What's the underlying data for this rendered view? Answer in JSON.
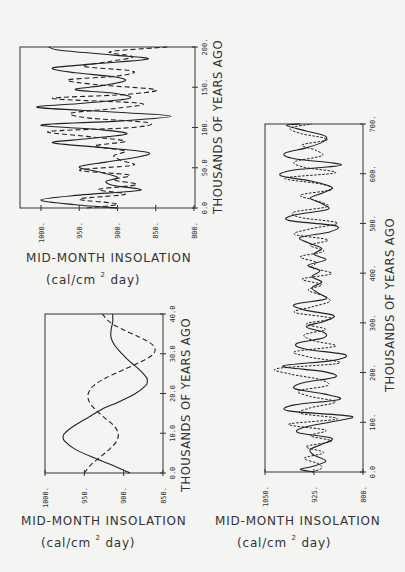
{
  "figure": {
    "value_label": "MID-MONTH INSOLATION",
    "unit_pre": "(cal/cm ",
    "unit_sup": "2",
    "unit_post": " day)",
    "time_label": "THOUSANDS OF YEARS AGO"
  },
  "chart_data": [
    {
      "id": "top-left",
      "type": "line",
      "title": "",
      "xlabel": "THOUSANDS OF YEARS AGO",
      "ylabel": "MID-MONTH INSOLATION (cal/cm² day)",
      "time_range": [
        0,
        200
      ],
      "value_range": [
        1028,
        800
      ],
      "time_ticks": [
        "0.0",
        "50.0",
        "100.",
        "150.",
        "200."
      ],
      "time_tick_values": [
        0,
        50,
        100,
        150,
        200
      ],
      "value_ticks": [
        "1000.",
        "950.",
        "900.",
        "850.",
        "800."
      ],
      "value_tick_values": [
        1000,
        950,
        900,
        850,
        800
      ],
      "grid": false,
      "series": [
        {
          "name": "solid",
          "style": "solid",
          "x": [
            0,
            4,
            10,
            16,
            22,
            28,
            33,
            38,
            45,
            51,
            57,
            63,
            69,
            75,
            81,
            86,
            92,
            97,
            103,
            108,
            114,
            119,
            125,
            130,
            136,
            142,
            147,
            152,
            158,
            163,
            168,
            174,
            179,
            185,
            190,
            196,
            200
          ],
          "values": [
            900,
            955,
            1000,
            950,
            870,
            905,
            915,
            900,
            925,
            950,
            915,
            875,
            860,
            920,
            985,
            940,
            888,
            920,
            1000,
            900,
            830,
            900,
            1005,
            945,
            885,
            900,
            955,
            920,
            890,
            905,
            955,
            985,
            930,
            860,
            905,
            975,
            990
          ]
        },
        {
          "name": "dashed",
          "style": "dashed",
          "x": [
            0,
            5,
            11,
            17,
            23,
            29,
            35,
            41,
            47,
            53,
            59,
            65,
            71,
            77,
            83,
            89,
            95,
            100,
            106,
            112,
            118,
            124,
            130,
            136,
            141,
            147,
            153,
            159,
            164,
            170,
            176,
            182,
            188,
            194,
            200
          ],
          "values": [
            940,
            900,
            950,
            890,
            925,
            875,
            905,
            885,
            950,
            880,
            895,
            905,
            890,
            930,
            890,
            940,
            990,
            880,
            860,
            940,
            960,
            900,
            870,
            985,
            890,
            850,
            925,
            965,
            900,
            880,
            945,
            910,
            880,
            910,
            835
          ]
        }
      ]
    },
    {
      "id": "bottom-left",
      "type": "line",
      "title": "",
      "xlabel": "THOUSANDS OF YEARS AGO",
      "ylabel": "MID-MONTH INSOLATION (cal/cm² day)",
      "time_range": [
        0,
        40
      ],
      "value_range": [
        1000,
        850
      ],
      "time_ticks": [
        "0.0",
        "10.0",
        "20.0",
        "30.0",
        "40.0"
      ],
      "time_tick_values": [
        0,
        10,
        20,
        30,
        40
      ],
      "value_ticks": [
        "1000.",
        "950.",
        "900.",
        "850."
      ],
      "value_tick_values": [
        1000,
        950,
        900,
        850
      ],
      "grid": false,
      "series": [
        {
          "name": "solid",
          "style": "solid",
          "x": [
            0,
            2,
            4,
            6,
            8,
            9,
            10,
            12,
            14,
            16,
            18,
            20,
            22,
            23,
            24,
            26,
            28,
            30,
            32,
            34,
            36,
            38,
            40
          ],
          "values": [
            892,
            915,
            940,
            962,
            975,
            977,
            975,
            962,
            945,
            928,
            905,
            885,
            872,
            870,
            871,
            880,
            892,
            902,
            911,
            916,
            916,
            914,
            914
          ],
          "note": "values estimated from pixel positions"
        },
        {
          "name": "dashed",
          "style": "dashed",
          "x": [
            0,
            2,
            4,
            6,
            8,
            10,
            12,
            14,
            16,
            18,
            20,
            22,
            24,
            26,
            28,
            30,
            32,
            34,
            36,
            38,
            40
          ],
          "values": [
            950,
            942,
            930,
            918,
            909,
            907,
            913,
            925,
            936,
            944,
            945,
            938,
            922,
            900,
            878,
            862,
            862,
            878,
            900,
            918,
            927
          ]
        }
      ]
    },
    {
      "id": "bottom-right",
      "type": "line",
      "title": "",
      "xlabel": "THOUSANDS OF YEARS AGO",
      "ylabel": "MID-MONTH INSOLATION (cal/cm² day)",
      "time_range": [
        0,
        700
      ],
      "value_range": [
        1050,
        800
      ],
      "time_ticks": [
        "0.0",
        "100.",
        "200.",
        "300.",
        "400.",
        "500.",
        "600.",
        "700."
      ],
      "time_tick_values": [
        0,
        100,
        200,
        300,
        400,
        500,
        600,
        700
      ],
      "value_ticks": [
        "1050.",
        "925.",
        "800."
      ],
      "value_tick_values": [
        1050,
        925,
        800
      ],
      "grid": false,
      "series": [
        {
          "name": "solid",
          "style": "solid",
          "x": [
            0,
            5,
            11,
            22,
            34,
            45,
            56,
            68,
            79,
            90,
            101,
            112,
            123,
            135,
            146,
            157,
            168,
            180,
            191,
            202,
            213,
            224,
            236,
            247,
            258,
            270,
            281,
            292,
            303,
            315,
            326,
            337,
            348,
            360,
            371,
            382,
            393,
            405,
            416,
            427,
            438,
            450,
            461,
            472,
            483,
            495,
            506,
            517,
            528,
            540,
            551,
            562,
            573,
            585,
            596,
            607,
            618,
            630,
            641,
            652,
            663,
            675,
            686,
            697,
            700
          ],
          "values": [
            925,
            960,
            930,
            895,
            925,
            935,
            905,
            880,
            965,
            950,
            880,
            830,
            990,
            975,
            860,
            900,
            975,
            950,
            870,
            900,
            1005,
            880,
            845,
            945,
            970,
            900,
            900,
            945,
            900,
            875,
            950,
            975,
            895,
            915,
            930,
            905,
            930,
            910,
            940,
            895,
            925,
            905,
            940,
            960,
            885,
            870,
            990,
            975,
            890,
            905,
            935,
            900,
            880,
            930,
            1010,
            980,
            855,
            975,
            1000,
            945,
            905,
            895,
            945,
            995,
            960
          ]
        },
        {
          "name": "dotted",
          "style": "dotted",
          "x": [
            0,
            8,
            17,
            28,
            39,
            51,
            62,
            73,
            84,
            96,
            107,
            118,
            129,
            141,
            152,
            163,
            174,
            186,
            197,
            208,
            219,
            231,
            242,
            253,
            264,
            276,
            287,
            298,
            309,
            321,
            332,
            343,
            354,
            366,
            377,
            388,
            399,
            411,
            422,
            433,
            444,
            456,
            467,
            478,
            489,
            501,
            512,
            523,
            534,
            546,
            557,
            568,
            579,
            591,
            602,
            613,
            624,
            636,
            647,
            658,
            669,
            681,
            692,
            700
          ],
          "values": [
            930,
            905,
            915,
            950,
            900,
            945,
            880,
            935,
            895,
            990,
            865,
            960,
            935,
            870,
            935,
            965,
            890,
            910,
            985,
            1020,
            860,
            935,
            975,
            870,
            925,
            950,
            895,
            945,
            880,
            975,
            930,
            885,
            900,
            940,
            905,
            955,
            880,
            930,
            920,
            960,
            900,
            935,
            890,
            975,
            935,
            865,
            960,
            975,
            890,
            920,
            960,
            880,
            905,
            1000,
            870,
            950,
            975,
            905,
            920,
            955,
            890,
            960,
            985,
            930
          ]
        }
      ]
    }
  ]
}
